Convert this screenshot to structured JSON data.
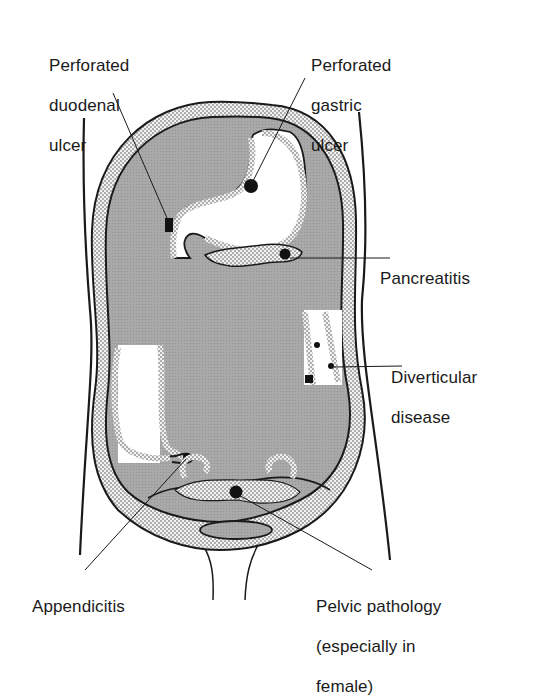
{
  "figure": {
    "type": "anatomical-diagram",
    "colors": {
      "peritoneal_cavity": "#a9a9a9",
      "wall": "#ececec",
      "outline": "#1a1a1a",
      "lesion": "#111111",
      "background": "#ffffff"
    }
  },
  "labels": {
    "duodenal": {
      "lines": [
        "Perforated",
        "duodenal",
        "ulcer"
      ]
    },
    "gastric": {
      "lines": [
        "Perforated",
        "gastric",
        "ulcer"
      ]
    },
    "pancreatitis": {
      "lines": [
        "Pancreatitis"
      ]
    },
    "diverticular": {
      "lines": [
        "Diverticular",
        "disease"
      ]
    },
    "appendicitis": {
      "lines": [
        "Appendicitis"
      ]
    },
    "pelvic": {
      "lines": [
        "Pelvic pathology",
        "(especially in",
        "female)"
      ]
    }
  }
}
